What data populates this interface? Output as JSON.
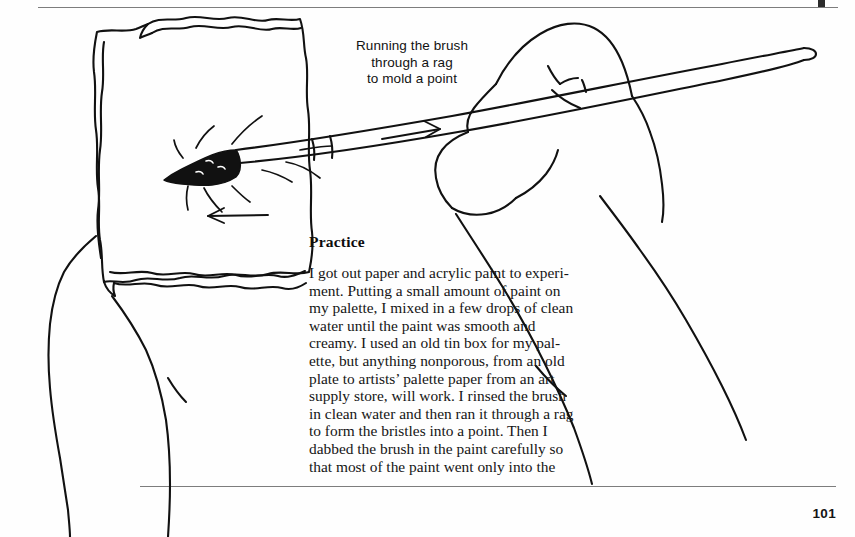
{
  "page": {
    "folio": "101",
    "background_color": "#fefefe",
    "ink_color": "#111111"
  },
  "illustration": {
    "name": "hand-pulling-brush-through-rag",
    "caption_lines": [
      "Running the brush",
      "through a rag",
      "to mold a point"
    ],
    "annotations": [
      {
        "name": "arrow-right-on-handle",
        "direction": "right"
      },
      {
        "name": "arrow-left-below-brush",
        "direction": "left"
      }
    ],
    "elements": [
      "rag-cloth",
      "left-hand-holding-rag",
      "right-hand-holding-brush",
      "paintbrush",
      "brush-ferrule",
      "brush-tip-loaded-with-paint"
    ]
  },
  "article": {
    "heading": "Practice",
    "paragraph_lines": [
      "I got out paper and acrylic paint to experi-",
      "ment. Putting a small amount of paint on",
      "my palette, I mixed in a few drops of clean",
      "water until the paint was smooth and",
      "creamy. I used an old tin box for my pal-",
      "ette, but anything nonporous, from an old",
      "plate to artists’ palette paper from an art",
      "supply store, will work. I rinsed the brush",
      "in clean water and then ran it through a rag",
      "to form the bristles into a point.  Then I",
      "dabbed the brush in the paint carefully so",
      "that most of the paint went only into the"
    ]
  }
}
